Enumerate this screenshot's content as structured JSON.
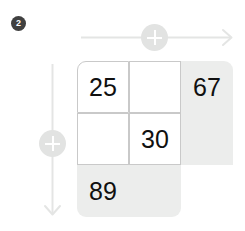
{
  "step": {
    "badge_label": "2"
  },
  "axes": {
    "horizontal": {
      "name": "horizontal-axis",
      "knob_icon": "plus-icon",
      "arrow_icon": "arrow-right-icon",
      "color": "#e4e5e4"
    },
    "vertical": {
      "name": "vertical-axis",
      "knob_icon": "plus-icon",
      "arrow_icon": "arrow-down-icon",
      "color": "#e4e5e4"
    }
  },
  "colors": {
    "filled_cell": "#ecedec",
    "cell_border": "#c9c9c9",
    "number": "#101010",
    "badge": "#404040",
    "knob": "#e2e3e2",
    "background": "#ffffff"
  },
  "grid": {
    "rows": 3,
    "cols": 3,
    "cells": [
      {
        "value": "25",
        "style": "outlined"
      },
      {
        "value": "",
        "style": "outlined"
      },
      {
        "value": "67",
        "style": "filled"
      },
      {
        "value": "",
        "style": "outlined"
      },
      {
        "value": "30",
        "style": "outlined"
      },
      {
        "value": "",
        "style": "filled"
      },
      {
        "value": "89",
        "style": "filled"
      },
      {
        "value": "",
        "style": "filled"
      },
      {
        "value": "",
        "style": "blank"
      }
    ]
  }
}
